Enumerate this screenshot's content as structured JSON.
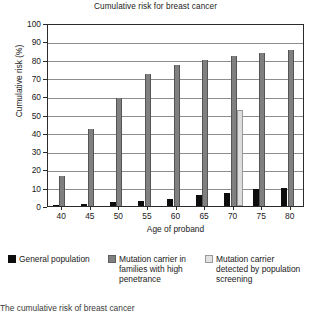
{
  "chart_data": {
    "type": "bar",
    "title": "Cumulative risk for breast cancer",
    "xlabel": "Age of proband",
    "ylabel": "Cumulative risk (%)",
    "categories": [
      "40",
      "45",
      "50",
      "55",
      "60",
      "65",
      "70",
      "75",
      "80"
    ],
    "ylim": [
      0,
      100
    ],
    "ytick_labels": [
      "0",
      "10",
      "20",
      "30",
      "40",
      "50",
      "60",
      "70",
      "80",
      "90",
      "100"
    ],
    "ytick_values": [
      0,
      10,
      20,
      30,
      40,
      50,
      60,
      70,
      80,
      90,
      100
    ],
    "grid": true,
    "legend_position": "below",
    "series": [
      {
        "name": "General population",
        "color": "#0d0d0d",
        "values": [
          0.7,
          1.1,
          2.0,
          2.9,
          4.0,
          6.0,
          7.2,
          9.2,
          9.7
        ]
      },
      {
        "name": "Mutation carrier in families with high penetrance",
        "color": "#808080",
        "values": [
          16.2,
          42.0,
          59.0,
          72.0,
          77.2,
          80.0,
          81.8,
          83.8,
          85.5
        ]
      },
      {
        "name": "Mutation carrier detected by population screening",
        "color": "#dcdcdc",
        "values": [
          null,
          null,
          null,
          null,
          null,
          null,
          52.3,
          null,
          null
        ]
      }
    ]
  },
  "legend": {
    "items": [
      {
        "label": "General population",
        "swatch": "black-swatch"
      },
      {
        "label": "Mutation carrier in families with high penetrance",
        "swatch": "gray-swatch"
      },
      {
        "label": "Mutation carrier detected by population screening",
        "swatch": "light-gray-swatch"
      }
    ]
  },
  "caption": "The cumulative risk of breast cancer"
}
